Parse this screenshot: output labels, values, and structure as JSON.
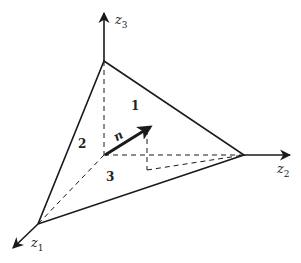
{
  "diagram": {
    "type": "tetrahedron-stress-element",
    "axes": [
      {
        "name": "z3",
        "base": "z",
        "sub": "3"
      },
      {
        "name": "z2",
        "base": "z",
        "sub": "2"
      },
      {
        "name": "z1",
        "base": "z",
        "sub": "1"
      }
    ],
    "faces": [
      {
        "label": "1"
      },
      {
        "label": "2"
      },
      {
        "label": "3"
      }
    ],
    "normal_vector": {
      "label": "n"
    },
    "colors": {
      "line": "#1a1a1a",
      "background": "#ffffff"
    }
  }
}
